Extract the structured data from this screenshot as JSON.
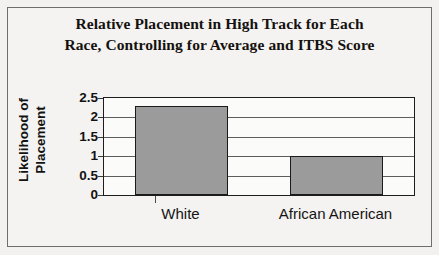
{
  "chart_data": {
    "type": "bar",
    "title": "Relative Placement in High Track for Each Race, Controlling for Average and ITBS Score",
    "title_lines": [
      "Relative Placement in High Track for Each",
      "Race, Controlling for Average and ITBS Score"
    ],
    "categories": [
      "White",
      "African American"
    ],
    "values": [
      2.3,
      1.0
    ],
    "xlabel": "",
    "ylabel": "Likelihood of Placement",
    "ylabel_lines": [
      "Likelihood of",
      "Placement"
    ],
    "ylim": [
      0,
      2.5
    ],
    "ytick_labels": [
      "2.5",
      "2",
      "1.5",
      "1",
      "0.5",
      "0"
    ],
    "ytick_values": [
      2.5,
      2,
      1.5,
      1,
      0.5,
      0
    ],
    "grid": true,
    "legend": false,
    "bar_color": "#9b9b9b",
    "bar_edge_color": "#1a1a1a",
    "plot_background": "#fbfbfa",
    "figure_background": "#f2f1ef",
    "axis_color": "#1d1d1d"
  }
}
